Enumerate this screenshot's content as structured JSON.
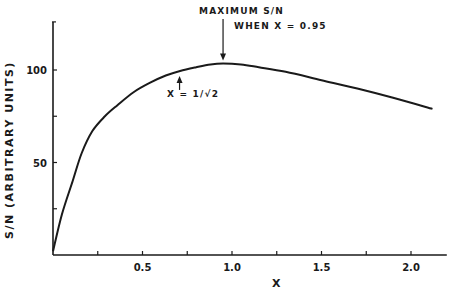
{
  "chart_data": {
    "type": "line",
    "title": "",
    "xlabel": "X",
    "ylabel": "S/N  (ARBITRARY UNITS)",
    "xlim": [
      0,
      2.2
    ],
    "ylim": [
      0,
      126
    ],
    "grid": false,
    "x_ticks": [
      {
        "value": 0.25,
        "label": ""
      },
      {
        "value": 0.5,
        "label": "0.5"
      },
      {
        "value": 0.75,
        "label": ""
      },
      {
        "value": 1.0,
        "label": "1.0"
      },
      {
        "value": 1.25,
        "label": ""
      },
      {
        "value": 1.5,
        "label": "1.5"
      },
      {
        "value": 1.75,
        "label": ""
      },
      {
        "value": 2.0,
        "label": "2.0"
      }
    ],
    "y_ticks": [
      {
        "value": 25,
        "label": ""
      },
      {
        "value": 50,
        "label": "50"
      },
      {
        "value": 75,
        "label": ""
      },
      {
        "value": 100,
        "label": "100"
      }
    ],
    "series": [
      {
        "name": "S/N",
        "x": [
          0,
          0.05,
          0.11,
          0.16,
          0.22,
          0.29,
          0.36,
          0.45,
          0.54,
          0.63,
          0.71,
          0.8,
          0.88,
          0.95,
          1.05,
          1.15,
          1.3,
          1.5,
          1.7,
          1.9,
          2.12
        ],
        "y": [
          2,
          22,
          40,
          55,
          67,
          75,
          81,
          88,
          93,
          97,
          99.5,
          101.5,
          103,
          103.5,
          103,
          101.5,
          99,
          94.5,
          90,
          85,
          79
        ]
      }
    ],
    "annotations": [
      {
        "text": "MAXIMUM S/N",
        "line2": "WHEN  X = 0.95",
        "x": 0.95,
        "y": 103.5,
        "arrow": "down"
      },
      {
        "text": "X = 1/√2",
        "x": 0.707,
        "y": 99.5,
        "arrow": "up"
      }
    ]
  }
}
